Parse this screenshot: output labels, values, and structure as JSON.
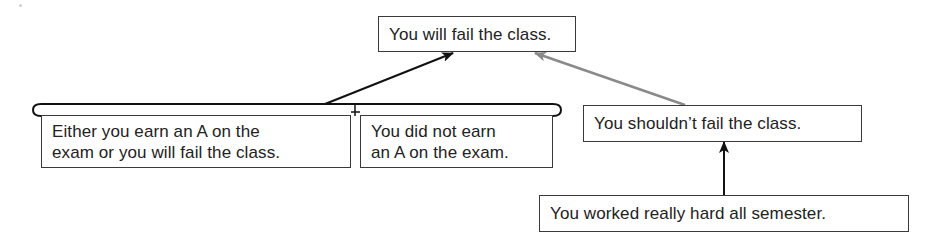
{
  "diagram": {
    "type": "argument-map",
    "nodes": {
      "conclusion": {
        "text": "You will fail the class."
      },
      "premise_disjunction": {
        "lines": [
          "Either you earn an A on the",
          "exam or you will fail the class."
        ]
      },
      "premise_not_a": {
        "lines": [
          "You did not earn",
          "an A on the exam."
        ]
      },
      "counter_claim": {
        "text": "You shouldn’t fail the class."
      },
      "counter_support": {
        "text": "You worked really hard all semester."
      }
    },
    "edges": [
      {
        "from": "premise_group",
        "to": "conclusion",
        "color": "#111111",
        "kind": "support"
      },
      {
        "from": "counter_claim",
        "to": "conclusion",
        "color": "#8a8a8a",
        "kind": "counter"
      },
      {
        "from": "counter_support",
        "to": "counter_claim",
        "color": "#111111",
        "kind": "support"
      }
    ],
    "colors": {
      "support_arrow": "#111111",
      "counter_arrow": "#8a8a8a",
      "box_border": "#3a3a3a",
      "text": "#222222"
    }
  }
}
